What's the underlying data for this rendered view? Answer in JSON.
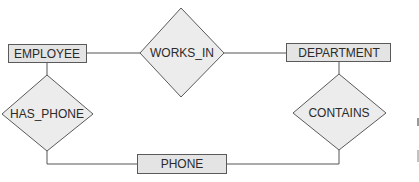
{
  "diagram": {
    "type": "ER diagram",
    "entities": [
      {
        "id": "employee",
        "label": "EMPLOYEE"
      },
      {
        "id": "department",
        "label": "DEPARTMENT"
      },
      {
        "id": "phone",
        "label": "PHONE"
      }
    ],
    "relationships": [
      {
        "id": "works_in",
        "label": "WORKS_IN",
        "connects": [
          "EMPLOYEE",
          "DEPARTMENT"
        ]
      },
      {
        "id": "has_phone",
        "label": "HAS_PHONE",
        "connects": [
          "EMPLOYEE",
          "PHONE"
        ]
      },
      {
        "id": "contains",
        "label": "CONTAINS",
        "connects": [
          "DEPARTMENT",
          "PHONE"
        ]
      }
    ],
    "colors": {
      "entity_fill": "#e4e4e4",
      "relationship_fill": "#ececec",
      "stroke": "#5a5a5a",
      "text": "#2a2a2a"
    }
  }
}
